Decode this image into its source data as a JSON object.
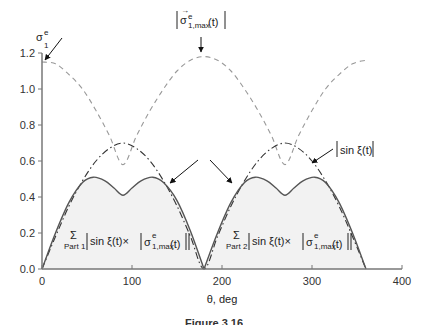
{
  "chart_data": {
    "type": "line",
    "title": "",
    "xlabel": "θ, deg",
    "ylabel": "σ₁ᵉ",
    "xlim": [
      0,
      400
    ],
    "ylim": [
      0.0,
      1.2
    ],
    "xticks": [
      0,
      100,
      200,
      300,
      400
    ],
    "yticks": [
      0.0,
      0.2,
      0.4,
      0.6,
      0.8,
      1.0,
      1.2
    ],
    "xtick_labels": [
      "0",
      "100",
      "200",
      "300",
      "400"
    ],
    "ytick_labels": [
      "0.0",
      "0.2",
      "0.4",
      "0.6",
      "0.8",
      "1.0",
      "1.2"
    ],
    "grid": false,
    "legend": "none (inline annotations)",
    "series": [
      {
        "name": "|σ⃗ᵉ1,max(t)|",
        "style": "dashed",
        "color": "#999999",
        "x": [
          0,
          15,
          30,
          45,
          60,
          75,
          90,
          105,
          120,
          135,
          150,
          165,
          180,
          195,
          210,
          225,
          240,
          255,
          270,
          285,
          300,
          315,
          330,
          345,
          360
        ],
        "values": [
          1.15,
          1.14,
          1.08,
          1.0,
          0.88,
          0.74,
          0.58,
          0.74,
          0.88,
          1.0,
          1.1,
          1.16,
          1.18,
          1.16,
          1.1,
          1.0,
          0.88,
          0.74,
          0.58,
          0.74,
          0.88,
          1.0,
          1.08,
          1.14,
          1.16
        ]
      },
      {
        "name": "|sin ξ(t)|",
        "style": "dash-dot",
        "color": "#333333",
        "x": [
          0,
          15,
          30,
          45,
          60,
          75,
          90,
          105,
          120,
          135,
          150,
          165,
          180,
          195,
          210,
          225,
          240,
          255,
          270,
          285,
          300,
          315,
          330,
          345,
          360
        ],
        "values": [
          0.0,
          0.18,
          0.35,
          0.49,
          0.6,
          0.67,
          0.7,
          0.67,
          0.6,
          0.49,
          0.35,
          0.18,
          0.0,
          0.18,
          0.35,
          0.49,
          0.6,
          0.67,
          0.7,
          0.67,
          0.6,
          0.49,
          0.35,
          0.18,
          0.0
        ]
      },
      {
        "name": "Σ Part 1 |sin ξ(t) × |σ⃗ᵉ1,max(t)||",
        "style": "solid-filled",
        "color": "#555555",
        "fill": "#f2f2f2",
        "x": [
          0,
          15,
          30,
          45,
          57,
          70,
          80,
          90,
          100,
          110,
          123,
          135,
          150,
          165,
          180
        ],
        "values": [
          0.0,
          0.2,
          0.37,
          0.48,
          0.51,
          0.49,
          0.45,
          0.41,
          0.45,
          0.49,
          0.51,
          0.48,
          0.38,
          0.21,
          0.0
        ]
      },
      {
        "name": "Σ Part 2 |sin ξ(t) × |σ⃗ᵉ1,max(t)||",
        "style": "solid-filled",
        "color": "#555555",
        "fill": "#f2f2f2",
        "x": [
          180,
          195,
          210,
          225,
          237,
          250,
          260,
          270,
          280,
          290,
          303,
          315,
          330,
          345,
          360
        ],
        "values": [
          0.0,
          0.2,
          0.37,
          0.48,
          0.51,
          0.49,
          0.45,
          0.41,
          0.45,
          0.49,
          0.51,
          0.48,
          0.37,
          0.2,
          0.0
        ]
      }
    ],
    "annotations": [
      {
        "text": "σ₁ᵉ",
        "target": [
          0,
          1.15
        ],
        "note": "arrow pointing to dashed curve at θ=0"
      },
      {
        "text": "|σ⃗ᵉ1,max(t)|",
        "target": [
          180,
          1.18
        ],
        "note": "arrow pointing down to dashed peak"
      },
      {
        "text": "|sin ξ(t)|",
        "target": [
          300,
          0.6
        ],
        "note": "arrow pointing to dash-dot curve"
      },
      {
        "text": "Σ Part 1 |sin ξ(t) × |σ⃗ᵉ1,max(t)||",
        "position": [
          15,
          0.15
        ]
      },
      {
        "text": "Σ Part 2 |sin ξ(t) × |σ⃗ᵉ1,max(t)||",
        "position": [
          200,
          0.15
        ]
      }
    ]
  },
  "labels": {
    "y_axis_symbol": "σ",
    "y_axis_sup": "e",
    "y_axis_sub": "1",
    "x_axis_label": "θ, deg",
    "sigma_max_main": "σ",
    "sigma_max_sup": "e",
    "sigma_max_sub": "1,max",
    "sigma_max_arg": "(t)",
    "sin_xi": "sin ξ(t)",
    "sum_symbol": "Σ",
    "part1": "Part 1",
    "part2": "Part 2",
    "product_text": "sin ξ(t)×",
    "caption": "Figure 3.16"
  },
  "axes": {
    "x_px_origin": 42,
    "x_px_per_unit": 0.9,
    "y_px_origin": 269,
    "y_px_per_unit": 180
  }
}
